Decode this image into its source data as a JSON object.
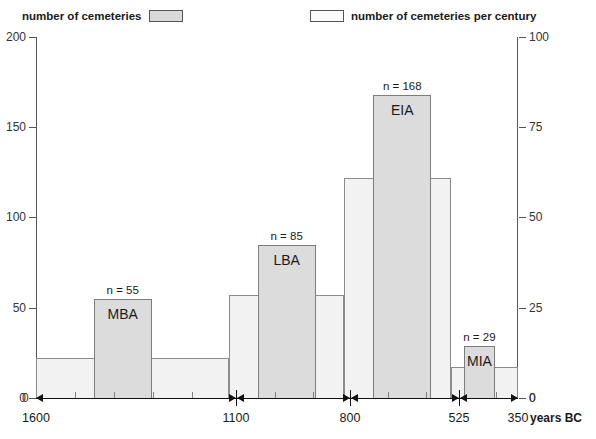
{
  "legend": {
    "left": {
      "label": "number of cemeteries",
      "swatch": "filled-grey-swatch",
      "color": "#d9d9d9"
    },
    "right": {
      "label": "number of cemeteries per century",
      "swatch": "empty-white-swatch",
      "color": "#f2f2f2"
    }
  },
  "axes": {
    "left_ticks": [
      "200",
      "150",
      "100",
      "50",
      "0"
    ],
    "right_ticks": [
      "100",
      "75",
      "50",
      "25",
      "0"
    ],
    "x_ticks": [
      "1600",
      "1100",
      "800",
      "525",
      "350"
    ],
    "x_units": "years BC"
  },
  "chart_data": {
    "type": "bar",
    "title": "",
    "xlabel": "years BC",
    "ylabel": "number of cemeteries",
    "ylabel_right": "number of cemeteries per century",
    "ylim": [
      0,
      200
    ],
    "ylim_right": [
      0,
      100
    ],
    "xlim_bc": [
      1600,
      350
    ],
    "grid": false,
    "legend_position": "top",
    "series": [
      {
        "name": "number of cemeteries",
        "axis": "left",
        "type": "bar",
        "color": "#dcdcdc",
        "points": [
          {
            "label": "MBA",
            "n_label": "n = 55",
            "value": 55,
            "start_bc": 1450,
            "end_bc": 1300
          },
          {
            "label": "LBA",
            "n_label": "n = 85",
            "value": 85,
            "start_bc": 1025,
            "end_bc": 875
          },
          {
            "label": "EIA",
            "n_label": "n = 168",
            "value": 168,
            "start_bc": 725,
            "end_bc": 575
          },
          {
            "label": "MIA",
            "n_label": "n = 29",
            "value": 29,
            "start_bc": 490,
            "end_bc": 410
          }
        ]
      },
      {
        "name": "number of cemeteries per century",
        "axis": "left",
        "type": "step",
        "color": "#f2f2f2",
        "steps": [
          {
            "start_bc": 1600,
            "end_bc": 1100,
            "value": 22,
            "per_century": 11
          },
          {
            "start_bc": 1100,
            "end_bc": 800,
            "value": 57,
            "per_century": 28.5
          },
          {
            "start_bc": 800,
            "end_bc": 525,
            "value": 122,
            "per_century": 61
          },
          {
            "start_bc": 525,
            "end_bc": 350,
            "value": 17,
            "per_century": 8.5
          }
        ]
      }
    ],
    "period_spans": [
      {
        "label": "MBA",
        "start_bc": 1600,
        "end_bc": 1100
      },
      {
        "label": "LBA",
        "start_bc": 1100,
        "end_bc": 800
      },
      {
        "label": "EIA",
        "start_bc": 800,
        "end_bc": 525
      },
      {
        "label": "MIA",
        "start_bc": 525,
        "end_bc": 350
      }
    ],
    "baseline_left_value": "0",
    "baseline_right_value": "0"
  }
}
